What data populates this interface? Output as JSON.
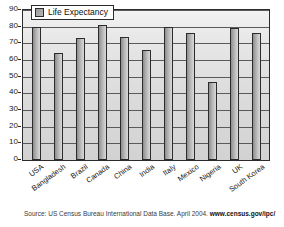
{
  "chart_data": {
    "type": "bar",
    "title": "",
    "xlabel": "",
    "ylabel": "",
    "ylim": [
      0,
      90
    ],
    "ytick_step": 10,
    "yticks": [
      90,
      80,
      70,
      60,
      50,
      40,
      30,
      20,
      10,
      0
    ],
    "grid": true,
    "legend_position": "top-left",
    "categories": [
      "USA",
      "Bangladesh",
      "Brazil",
      "Canada",
      "China",
      "India",
      "Italy",
      "Mexico",
      "Nigeria",
      "UK",
      "South Korea"
    ],
    "series": [
      {
        "name": "Life Expectancy",
        "values": [
          80,
          64,
          73,
          81,
          74,
          66,
          80,
          76,
          47,
          79,
          76
        ]
      }
    ]
  },
  "legend": {
    "entries": [
      {
        "label": "Life Expectancy",
        "swatch_color": "#a7a7a7"
      }
    ]
  },
  "caption": {
    "source_text": "Source: US Census Bureau International Data Base. April 2004.",
    "url_text": "www.census.gov/ipc/"
  },
  "colors": {
    "bar_fill": "#a7a7a7",
    "bar_border": "#2b2b2b",
    "plot_background": "#e0e0e0",
    "gridline": "#5a5a5a",
    "axis": "#2b2b2b",
    "text": "#1a1a1a"
  }
}
